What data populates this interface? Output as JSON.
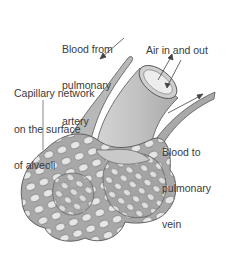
{
  "figure": {
    "labels": {
      "artery": [
        "Blood from",
        "pulmonary",
        "artery"
      ],
      "air": [
        "Air in and out"
      ],
      "capillary": [
        "Capillary network",
        "on the surface",
        "of alveoli"
      ],
      "vein": [
        "Blood to",
        "pulmonary",
        "vein"
      ]
    },
    "colors": {
      "background": "#ffffff",
      "tissue_fill": "#b9b9b9",
      "tissue_light": "#d8d8d8",
      "outline": "#555555",
      "text": "#3a3a3a"
    }
  }
}
